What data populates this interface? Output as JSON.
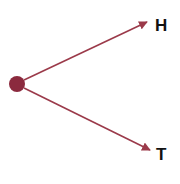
{
  "diagram": {
    "type": "probability-tree",
    "colors": {
      "node": "#8b2a3e",
      "edge": "#9b3a4a",
      "label": "#111111"
    },
    "root": {
      "x": 17,
      "y": 84,
      "r": 8
    },
    "branches": [
      {
        "label": "H",
        "x1": 24,
        "y1": 80,
        "x2": 147,
        "y2": 22,
        "label_x": 155,
        "label_y": 17
      },
      {
        "label": "T",
        "x1": 24,
        "y1": 88,
        "x2": 150,
        "y2": 150,
        "label_x": 156,
        "label_y": 146
      }
    ]
  }
}
